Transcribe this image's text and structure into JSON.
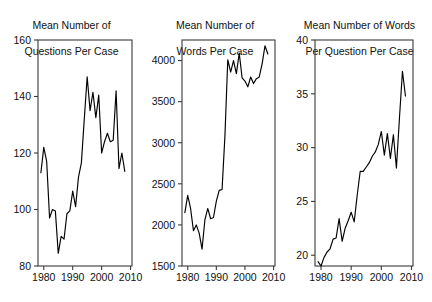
{
  "figure": {
    "width": 432,
    "height": 302,
    "background": "#ffffff",
    "line_color": "#000000",
    "axis_color": "#3a3a3a",
    "text_color": "#111111"
  },
  "panels": [
    {
      "id": "questions-per-case",
      "title_line1": "Mean Number of",
      "title_line2": "Questions Per Case"
    },
    {
      "id": "words-per-case",
      "title_line1": "Mean Number of",
      "title_line2": "Words Per Case"
    },
    {
      "id": "words-per-question-per-case",
      "title_line1": "Mean Number of Words",
      "title_line2": "Per Question Per Case"
    }
  ],
  "chart_data": [
    {
      "type": "line",
      "title": "Mean Number of Questions Per Case",
      "xlabel": "",
      "ylabel": "",
      "xlim": [
        1978,
        2010.5
      ],
      "ylim": [
        80,
        160
      ],
      "xticks": [
        1980,
        1990,
        2000,
        2010
      ],
      "yticks": [
        80,
        100,
        120,
        140,
        160
      ],
      "xticklabels": [
        "1980",
        "1990",
        "2000",
        "2010"
      ],
      "yticklabels": [
        "80",
        "100",
        "120",
        "140",
        "160"
      ],
      "grid": false,
      "legend": "none",
      "x": [
        1979,
        1980,
        1981,
        1982,
        1983,
        1984,
        1985,
        1986,
        1987,
        1988,
        1989,
        1990,
        1991,
        1992,
        1993,
        1994,
        1995,
        1996,
        1997,
        1998,
        1999,
        2000,
        2001,
        2002,
        2003,
        2004,
        2005,
        2006,
        2007,
        2008
      ],
      "values": [
        113.0,
        122.0,
        117.0,
        97.0,
        100.0,
        99.5,
        84.5,
        90.5,
        89.5,
        98.5,
        99.5,
        106.5,
        101.0,
        111.5,
        116.5,
        132.0,
        147.0,
        135.0,
        141.5,
        132.5,
        140.5,
        120.0,
        124.0,
        127.0,
        124.0,
        124.5,
        142.0,
        114.5,
        120.0,
        113.5
      ]
    },
    {
      "type": "line",
      "title": "Mean Number of Words Per Case",
      "xlabel": "",
      "ylabel": "",
      "xlim": [
        1978,
        2010.5
      ],
      "ylim": [
        1500,
        4250
      ],
      "xticks": [
        1980,
        1990,
        2000,
        2010
      ],
      "yticks": [
        1500,
        2000,
        2500,
        3000,
        3500,
        4000
      ],
      "xticklabels": [
        "1980",
        "1990",
        "2000",
        "2010"
      ],
      "yticklabels": [
        "1500",
        "2000",
        "2500",
        "3000",
        "3500",
        "4000"
      ],
      "grid": false,
      "legend": "none",
      "x": [
        1979,
        1980,
        1981,
        1982,
        1983,
        1984,
        1985,
        1986,
        1987,
        1988,
        1989,
        1990,
        1991,
        1992,
        1993,
        1994,
        1995,
        1996,
        1997,
        1998,
        1999,
        2000,
        2001,
        2002,
        2003,
        2004,
        2005,
        2006,
        2007,
        2008
      ],
      "values": [
        2150,
        2360,
        2200,
        1930,
        2000,
        1900,
        1705,
        2060,
        2200,
        2075,
        2090,
        2290,
        2420,
        2430,
        3080,
        4010,
        3860,
        4000,
        3840,
        4090,
        3790,
        3750,
        3680,
        3800,
        3720,
        3780,
        3800,
        3960,
        4180,
        4080
      ]
    },
    {
      "type": "line",
      "title": "Mean Number of Words Per Question Per Case",
      "xlabel": "",
      "ylabel": "",
      "xlim": [
        1978,
        2010.5
      ],
      "ylim": [
        19,
        40
      ],
      "xticks": [
        1980,
        1990,
        2000,
        2010
      ],
      "yticks": [
        20,
        25,
        30,
        35,
        40
      ],
      "xticklabels": [
        "1980",
        "1990",
        "2000",
        "2010"
      ],
      "yticklabels": [
        "20",
        "25",
        "30",
        "35",
        "40"
      ],
      "grid": false,
      "legend": "none",
      "x": [
        1979,
        1980,
        1981,
        1982,
        1983,
        1984,
        1985,
        1986,
        1987,
        1988,
        1989,
        1990,
        1991,
        1992,
        1993,
        1994,
        1995,
        1996,
        1997,
        1998,
        1999,
        2000,
        2001,
        2002,
        2003,
        2004,
        2005,
        2006,
        2007,
        2008
      ],
      "values": [
        19.4,
        19.0,
        19.8,
        20.3,
        20.6,
        21.5,
        21.6,
        23.4,
        21.3,
        22.5,
        23.2,
        24.0,
        23.1,
        25.6,
        27.8,
        27.8,
        28.2,
        28.6,
        29.2,
        29.6,
        30.3,
        31.5,
        29.3,
        31.3,
        29.0,
        31.2,
        28.1,
        32.7,
        37.1,
        34.8
      ]
    }
  ]
}
